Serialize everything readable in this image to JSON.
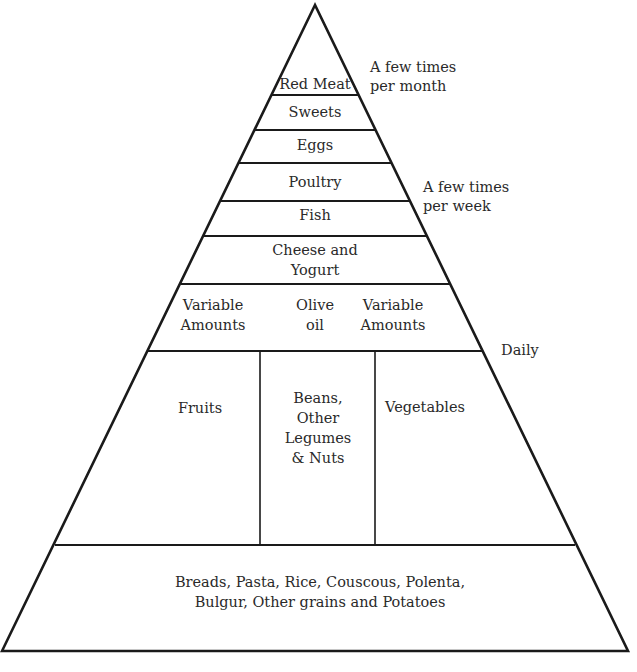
{
  "diagram": {
    "tiers": [
      {
        "id": "red-meat",
        "label": "Red Meat"
      },
      {
        "id": "sweets",
        "label": "Sweets"
      },
      {
        "id": "eggs",
        "label": "Eggs"
      },
      {
        "id": "poultry",
        "label": "Poultry"
      },
      {
        "id": "fish",
        "label": "Fish"
      },
      {
        "id": "cheese-yogurt",
        "label_line1": "Cheese and",
        "label_line2": "Yogurt"
      },
      {
        "id": "olive-oil",
        "left_line1": "Variable",
        "left_line2": "Amounts",
        "center_line1": "Olive",
        "center_line2": "oil",
        "right_line1": "Variable",
        "right_line2": "Amounts"
      },
      {
        "id": "plants",
        "fruits": "Fruits",
        "beans_line1": "Beans,",
        "beans_line2": "Other",
        "beans_line3": "Legumes",
        "beans_line4": "& Nuts",
        "vegetables": "Vegetables"
      },
      {
        "id": "grains",
        "label_line1": "Breads, Pasta, Rice, Couscous, Polenta,",
        "label_line2": "Bulgur, Other grains and Potatoes"
      }
    ],
    "frequency_labels": {
      "monthly_line1": "A few times",
      "monthly_line2": "per month",
      "weekly_line1": "A few times",
      "weekly_line2": "per week",
      "daily": "Daily"
    },
    "colors": {
      "line": "#1a1a1a",
      "text": "#2a2a2a",
      "background": "#ffffff"
    }
  }
}
